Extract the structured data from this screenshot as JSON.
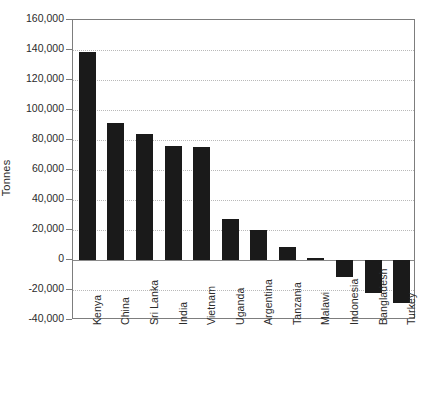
{
  "chart_data": {
    "type": "bar",
    "title": "",
    "xlabel": "",
    "ylabel": "Tonnes",
    "ylim": [
      -40000,
      160000
    ],
    "ytick_step": 20000,
    "grid": true,
    "legend": null,
    "orientation": "vertical",
    "bar_color": "#1a1a1a",
    "categories": [
      "Kenya",
      "China",
      "Sri Lanka",
      "India",
      "Vietnam",
      "Uganda",
      "Argentina",
      "Tanzania",
      "Malawi",
      "Indonesia",
      "Bangladesh",
      "Turkey"
    ],
    "values": [
      138700,
      91300,
      84000,
      76000,
      75300,
      27300,
      20000,
      8700,
      1500,
      -11300,
      -22000,
      -28700
    ],
    "ytick_labels": [
      "160,000",
      "140,000",
      "120,000",
      "100,000",
      "80,000",
      "60,000",
      "40,000",
      "20,000",
      "0",
      "-20,000",
      "-40,000"
    ],
    "ytick_values": [
      160000,
      140000,
      120000,
      100000,
      80000,
      60000,
      40000,
      20000,
      0,
      -20000,
      -40000
    ]
  }
}
